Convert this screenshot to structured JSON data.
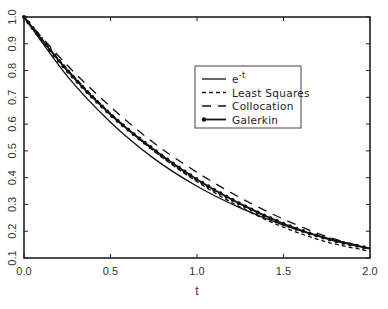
{
  "chart_data": {
    "type": "line",
    "title": "",
    "xlabel": "t",
    "ylabel": "",
    "xlim": [
      0.0,
      2.0
    ],
    "ylim": [
      0.1,
      1.0
    ],
    "grid": false,
    "legend_position": "upper-right-center (inside plot)",
    "x_ticks": [
      "0.0",
      "0.5",
      "1.0",
      "1.5",
      "2.0"
    ],
    "y_ticks": [
      "0.1",
      "0.2",
      "0.3",
      "0.4",
      "0.5",
      "0.6",
      "0.7",
      "0.8",
      "0.9",
      "1.0"
    ],
    "x": [
      0.0,
      0.25,
      0.5,
      0.75,
      1.0,
      1.25,
      1.5,
      1.75,
      2.0
    ],
    "series": [
      {
        "name": "e^-t",
        "legend_label": "e",
        "legend_superscript": "-t",
        "style": "solid",
        "values": [
          1.0,
          0.779,
          0.607,
          0.472,
          0.368,
          0.287,
          0.223,
          0.174,
          0.135
        ]
      },
      {
        "name": "Least Squares",
        "legend_label": "Least Squares",
        "style": "short-dash",
        "values": [
          1.0,
          0.805,
          0.64,
          0.5,
          0.385,
          0.29,
          0.215,
          0.16,
          0.125
        ]
      },
      {
        "name": "Collocation",
        "legend_label": "Collocation",
        "style": "long-dash",
        "values": [
          1.0,
          0.82,
          0.665,
          0.53,
          0.42,
          0.325,
          0.245,
          0.18,
          0.135
        ]
      },
      {
        "name": "Galerkin",
        "legend_label": "Galerkin",
        "style": "solid-with-dots",
        "values": [
          1.0,
          0.8,
          0.636,
          0.505,
          0.393,
          0.302,
          0.228,
          0.172,
          0.135
        ]
      }
    ]
  }
}
